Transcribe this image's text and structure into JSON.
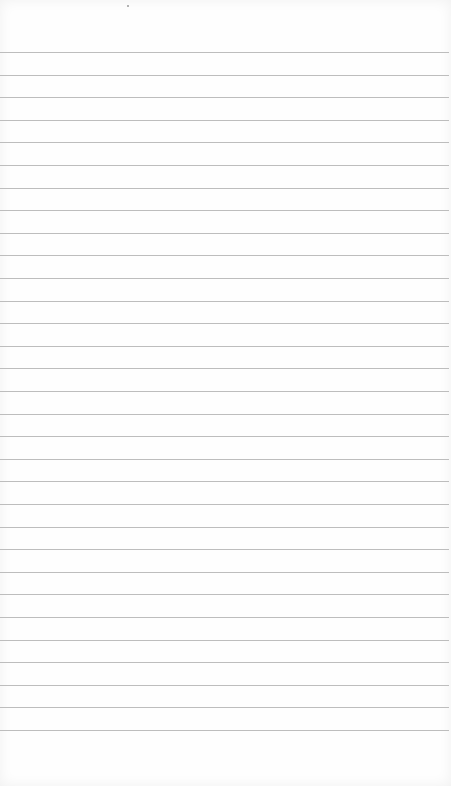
{
  "page": {
    "type": "lined-paper",
    "background_color": "#fefefe",
    "line_color": "#bdbdbd",
    "line_count": 31,
    "first_line_y": 52,
    "line_spacing": 22.6
  }
}
